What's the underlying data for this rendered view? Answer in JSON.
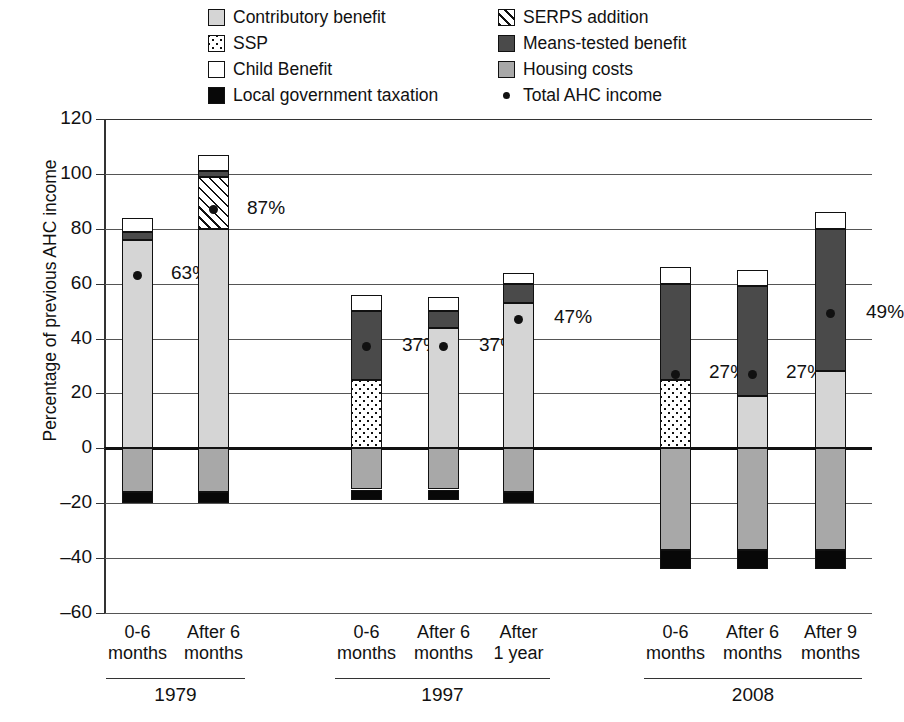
{
  "chart_data": {
    "type": "bar",
    "subtype": "stacked-bar-with-points",
    "title": "",
    "xlabel": "",
    "ylabel": "Percentage of previous AHC income",
    "ylim": [
      -60,
      120
    ],
    "yticks": [
      120,
      100,
      80,
      60,
      40,
      20,
      0,
      -20,
      -40,
      -60
    ],
    "ytick_labels": [
      "120",
      "100",
      "80",
      "60",
      "40",
      "20",
      "0",
      "–20",
      "–40",
      "–60"
    ],
    "grid": true,
    "legend_position": "top",
    "legend": [
      {
        "label": "Contributory benefit",
        "key": "contributory",
        "fill": "light-grey"
      },
      {
        "label": "SERPS addition",
        "key": "serps",
        "fill": "diagonal-hatch"
      },
      {
        "label": "SSP",
        "key": "ssp",
        "fill": "checkered-dots"
      },
      {
        "label": "Means-tested benefit",
        "key": "means_tested",
        "fill": "dark-grey"
      },
      {
        "label": "Child Benefit",
        "key": "child_benefit",
        "fill": "white"
      },
      {
        "label": "Housing costs",
        "key": "housing_costs",
        "fill": "mid-grey"
      },
      {
        "label": "Local government taxation",
        "key": "local_tax",
        "fill": "black"
      },
      {
        "label": "Total AHC income",
        "key": "total_ahc",
        "fill": "dot-marker"
      }
    ],
    "groups": [
      {
        "name": "1979",
        "categories": [
          "0-6 months",
          "After 6 months"
        ]
      },
      {
        "name": "1997",
        "categories": [
          "0-6 months",
          "After 6 months",
          "After 1 year"
        ]
      },
      {
        "name": "2008",
        "categories": [
          "0-6 months",
          "After 6 months",
          "After 9 months"
        ]
      }
    ],
    "bars": [
      {
        "group": "1979",
        "category": "0-6 months",
        "category_line1": "0-6",
        "category_line2": "months",
        "segments": [
          {
            "key": "local_tax",
            "from": -20,
            "to": -16
          },
          {
            "key": "housing_costs",
            "from": -16,
            "to": 0
          },
          {
            "key": "contributory",
            "from": 0,
            "to": 76
          },
          {
            "key": "means_tested",
            "from": 76,
            "to": 79
          },
          {
            "key": "child_benefit",
            "from": 79,
            "to": 84
          }
        ],
        "total_ahc": 63,
        "total_label": "63%"
      },
      {
        "group": "1979",
        "category": "After 6 months",
        "category_line1": "After 6",
        "category_line2": "months",
        "segments": [
          {
            "key": "local_tax",
            "from": -20,
            "to": -16
          },
          {
            "key": "housing_costs",
            "from": -16,
            "to": 0
          },
          {
            "key": "contributory",
            "from": 0,
            "to": 80
          },
          {
            "key": "serps",
            "from": 80,
            "to": 99
          },
          {
            "key": "means_tested",
            "from": 99,
            "to": 101
          },
          {
            "key": "child_benefit",
            "from": 101,
            "to": 107
          }
        ],
        "total_ahc": 87,
        "total_label": "87%"
      },
      {
        "group": "1997",
        "category": "0-6 months",
        "category_line1": "0-6",
        "category_line2": "months",
        "segments": [
          {
            "key": "local_tax",
            "from": -19,
            "to": -15
          },
          {
            "key": "housing_costs",
            "from": -15,
            "to": 0
          },
          {
            "key": "ssp",
            "from": 0,
            "to": 25
          },
          {
            "key": "means_tested",
            "from": 25,
            "to": 50
          },
          {
            "key": "child_benefit",
            "from": 50,
            "to": 56
          }
        ],
        "total_ahc": 37,
        "total_label": "37%"
      },
      {
        "group": "1997",
        "category": "After 6 months",
        "category_line1": "After 6",
        "category_line2": "months",
        "segments": [
          {
            "key": "local_tax",
            "from": -19,
            "to": -15
          },
          {
            "key": "housing_costs",
            "from": -15,
            "to": 0
          },
          {
            "key": "contributory",
            "from": 0,
            "to": 44
          },
          {
            "key": "means_tested",
            "from": 44,
            "to": 50
          },
          {
            "key": "child_benefit",
            "from": 50,
            "to": 55
          }
        ],
        "total_ahc": 37,
        "total_label": "37%"
      },
      {
        "group": "1997",
        "category": "After 1 year",
        "category_line1": "After",
        "category_line2": "1 year",
        "segments": [
          {
            "key": "local_tax",
            "from": -20,
            "to": -16
          },
          {
            "key": "housing_costs",
            "from": -16,
            "to": 0
          },
          {
            "key": "contributory",
            "from": 0,
            "to": 53
          },
          {
            "key": "means_tested",
            "from": 53,
            "to": 60
          },
          {
            "key": "child_benefit",
            "from": 60,
            "to": 64
          }
        ],
        "total_ahc": 47,
        "total_label": "47%"
      },
      {
        "group": "2008",
        "category": "0-6 months",
        "category_line1": "0-6",
        "category_line2": "months",
        "segments": [
          {
            "key": "local_tax",
            "from": -44,
            "to": -37
          },
          {
            "key": "housing_costs",
            "from": -37,
            "to": 0
          },
          {
            "key": "ssp",
            "from": 0,
            "to": 25
          },
          {
            "key": "means_tested",
            "from": 25,
            "to": 60
          },
          {
            "key": "child_benefit",
            "from": 60,
            "to": 66
          }
        ],
        "total_ahc": 27,
        "total_label": "27%"
      },
      {
        "group": "2008",
        "category": "After 6 months",
        "category_line1": "After 6",
        "category_line2": "months",
        "segments": [
          {
            "key": "local_tax",
            "from": -44,
            "to": -37
          },
          {
            "key": "housing_costs",
            "from": -37,
            "to": 0
          },
          {
            "key": "contributory",
            "from": 0,
            "to": 19
          },
          {
            "key": "means_tested",
            "from": 19,
            "to": 59
          },
          {
            "key": "child_benefit",
            "from": 59,
            "to": 65
          }
        ],
        "total_ahc": 27,
        "total_label": "27%"
      },
      {
        "group": "2008",
        "category": "After 9 months",
        "category_line1": "After 9",
        "category_line2": "months",
        "segments": [
          {
            "key": "local_tax",
            "from": -44,
            "to": -37
          },
          {
            "key": "housing_costs",
            "from": -37,
            "to": 0
          },
          {
            "key": "contributory",
            "from": 0,
            "to": 28
          },
          {
            "key": "means_tested",
            "from": 28,
            "to": 80
          },
          {
            "key": "child_benefit",
            "from": 80,
            "to": 86
          }
        ],
        "total_ahc": 49,
        "total_label": "49%"
      }
    ],
    "colors": {
      "contributory": "#d5d5d5",
      "ssp": "#ffffff",
      "child_benefit": "#ffffff",
      "local_tax": "#080808",
      "serps": "#ffffff",
      "means_tested": "#4a4a4a",
      "housing_costs": "#a8a8a8",
      "total_ahc": "#111111",
      "axis": "#333333",
      "grid": "#555555"
    }
  }
}
